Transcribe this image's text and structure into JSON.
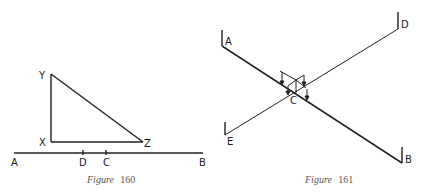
{
  "figures": [
    {
      "caption_word": "Figure",
      "caption_number": "160",
      "labels": {
        "Y": "Y",
        "X": "X",
        "Z": "Z",
        "A": "A",
        "D": "D",
        "C": "C",
        "B": "B"
      },
      "description": "Right triangle XYZ above horizontal line AB with tick marks D and C"
    },
    {
      "caption_word": "Figure",
      "caption_number": "161",
      "labels": {
        "A": "A",
        "D": "D",
        "C": "C",
        "E": "E",
        "B": "B"
      },
      "description": "Two crossing lines AB and DE intersecting at C with small vertical arrows near the intersection"
    }
  ],
  "colors": {
    "line": "#222222",
    "caption": "#555555"
  }
}
